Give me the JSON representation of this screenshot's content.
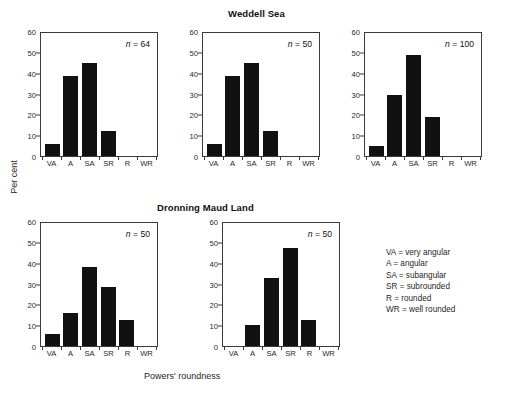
{
  "figure": {
    "ylabel": "Per cent",
    "xlabel": "Powers' roundness",
    "group_titles": {
      "top": "Weddell Sea",
      "bottom": "Dronning Maud Land"
    }
  },
  "legend": {
    "entries": [
      "VA = very angular",
      "A = angular",
      "SA = subangular",
      "SR = subrounded",
      "R = rounded",
      "WR = well rounded"
    ]
  },
  "axis": {
    "yticks": [
      "0",
      "10",
      "20",
      "30",
      "40",
      "50",
      "60"
    ],
    "xticks": [
      "VA",
      "A",
      "SA",
      "SR",
      "R",
      "WR"
    ]
  },
  "panels": [
    {
      "id": "weddell-1",
      "n_label": "n = 64"
    },
    {
      "id": "weddell-2",
      "n_label": "n = 50"
    },
    {
      "id": "weddell-3",
      "n_label": "n = 100"
    },
    {
      "id": "dronning-1",
      "n_label": "n = 50"
    },
    {
      "id": "dronning-2",
      "n_label": "n = 50"
    }
  ],
  "chart_data": [
    {
      "type": "bar",
      "title": "Weddell Sea",
      "subtitle": "n = 64",
      "categories": [
        "VA",
        "A",
        "SA",
        "SR",
        "R",
        "WR"
      ],
      "values": [
        6,
        38.5,
        44.5,
        12,
        0,
        0
      ],
      "xlabel": "Powers' roundness",
      "ylabel": "Per cent",
      "ylim": [
        0,
        60
      ],
      "ytick_step": 10,
      "grid": false,
      "legend": "none",
      "sample_size": 64
    },
    {
      "type": "bar",
      "title": "Weddell Sea",
      "subtitle": "n = 50",
      "categories": [
        "VA",
        "A",
        "SA",
        "SR",
        "R",
        "WR"
      ],
      "values": [
        6,
        38.5,
        44.5,
        12,
        0,
        0
      ],
      "xlabel": "Powers' roundness",
      "ylabel": "Per cent",
      "ylim": [
        0,
        60
      ],
      "ytick_step": 10,
      "grid": false,
      "legend": "none",
      "sample_size": 50
    },
    {
      "type": "bar",
      "title": "Weddell Sea",
      "subtitle": "n = 100",
      "categories": [
        "VA",
        "A",
        "SA",
        "SR",
        "R",
        "WR"
      ],
      "values": [
        5,
        29.5,
        48.5,
        18.5,
        0,
        0
      ],
      "xlabel": "Powers' roundness",
      "ylabel": "Per cent",
      "ylim": [
        0,
        60
      ],
      "ytick_step": 10,
      "grid": false,
      "legend": "none",
      "sample_size": 100
    },
    {
      "type": "bar",
      "title": "Dronning Maud Land",
      "subtitle": "n = 50",
      "categories": [
        "VA",
        "A",
        "SA",
        "SR",
        "R",
        "WR"
      ],
      "values": [
        6,
        16,
        38,
        28.5,
        12.5,
        0
      ],
      "xlabel": "Powers' roundness",
      "ylabel": "Per cent",
      "ylim": [
        0,
        60
      ],
      "ytick_step": 10,
      "grid": false,
      "legend": "none",
      "sample_size": 50
    },
    {
      "type": "bar",
      "title": "Dronning Maud Land",
      "subtitle": "n = 50",
      "categories": [
        "VA",
        "A",
        "SA",
        "SR",
        "R",
        "WR"
      ],
      "values": [
        0,
        10,
        32.5,
        47,
        12.5,
        0
      ],
      "xlabel": "Powers' roundness",
      "ylabel": "Per cent",
      "ylim": [
        0,
        60
      ],
      "ytick_step": 10,
      "grid": false,
      "legend": "none",
      "sample_size": 50
    }
  ]
}
